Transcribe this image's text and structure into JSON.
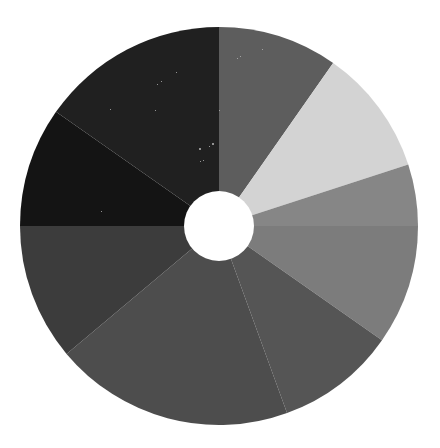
{
  "page": {
    "background_color": "#ffffff",
    "width": 440,
    "height": 448
  },
  "figure": {
    "name": "donut-chart",
    "center_x": 219,
    "center_y": 226,
    "outer_radius_x": 199,
    "outer_radius_y": 199,
    "inner_radius": 35,
    "hole_color": "#ffffff",
    "rotation_deg": 0
  },
  "chart_data": {
    "type": "pie",
    "variant": "donut",
    "title": "",
    "subtitle": "",
    "xlabel": "",
    "ylabel": "",
    "legend": false,
    "legend_position": "none",
    "grid": false,
    "labels_visible": false,
    "start_angle_deg": 0,
    "direction": "clockwise",
    "inner_radius_ratio": 0.176,
    "total": 100,
    "categories": [
      "Segment 1",
      "Segment 2",
      "Segment 3",
      "Segment 4",
      "Segment 5",
      "Segment 6",
      "Segment 7",
      "Segment 8",
      "Segment 9"
    ],
    "values": [
      9.7,
      10.3,
      5.0,
      9.7,
      9.7,
      19.5,
      11.1,
      9.7,
      15.3
    ],
    "angles_deg": [
      35,
      37,
      18,
      35,
      35,
      70,
      40,
      35,
      55
    ],
    "colors": [
      "#5d5d5d",
      "#d3d3d3",
      "#868686",
      "#7c7c7c",
      "#555555",
      "#4d4d4d",
      "#3c3c3c",
      "#141414",
      "#202020"
    ],
    "segment_boundaries_deg": [
      0,
      35,
      72,
      90,
      125,
      160,
      230,
      270,
      305,
      360
    ]
  },
  "segments": [
    {
      "name": "segment-1",
      "color": "#5d5d5d",
      "start_deg": 0,
      "end_deg": 35,
      "value": 9.7
    },
    {
      "name": "segment-2",
      "color": "#d3d3d3",
      "start_deg": 35,
      "end_deg": 72,
      "value": 10.3
    },
    {
      "name": "segment-3",
      "color": "#868686",
      "start_deg": 72,
      "end_deg": 90,
      "value": 5.0
    },
    {
      "name": "segment-4",
      "color": "#7c7c7c",
      "start_deg": 90,
      "end_deg": 125,
      "value": 9.7
    },
    {
      "name": "segment-5",
      "color": "#555555",
      "start_deg": 125,
      "end_deg": 160,
      "value": 9.7
    },
    {
      "name": "segment-6",
      "color": "#4d4d4d",
      "start_deg": 160,
      "end_deg": 230,
      "value": 19.5
    },
    {
      "name": "segment-7",
      "color": "#3c3c3c",
      "start_deg": 230,
      "end_deg": 270,
      "value": 11.1
    },
    {
      "name": "segment-8",
      "color": "#141414",
      "start_deg": 270,
      "end_deg": 305,
      "value": 9.7
    },
    {
      "name": "segment-9",
      "color": "#202020",
      "start_deg": 305,
      "end_deg": 360,
      "value": 15.3
    }
  ],
  "speckles": [
    {
      "x": 262,
      "y": 49,
      "size": 1
    },
    {
      "x": 240,
      "y": 56,
      "size": 1
    },
    {
      "x": 237,
      "y": 58,
      "size": 1
    },
    {
      "x": 176,
      "y": 72,
      "size": 1
    },
    {
      "x": 161,
      "y": 81,
      "size": 1
    },
    {
      "x": 157,
      "y": 84,
      "size": 1
    },
    {
      "x": 219,
      "y": 110,
      "size": 1
    },
    {
      "x": 212,
      "y": 143,
      "size": 2
    },
    {
      "x": 209,
      "y": 146,
      "size": 1
    },
    {
      "x": 199,
      "y": 148,
      "size": 2
    },
    {
      "x": 203,
      "y": 160,
      "size": 1
    },
    {
      "x": 200,
      "y": 161,
      "size": 1
    },
    {
      "x": 155,
      "y": 110,
      "size": 1
    },
    {
      "x": 101,
      "y": 211,
      "size": 1
    },
    {
      "x": 110,
      "y": 109,
      "size": 1
    }
  ]
}
